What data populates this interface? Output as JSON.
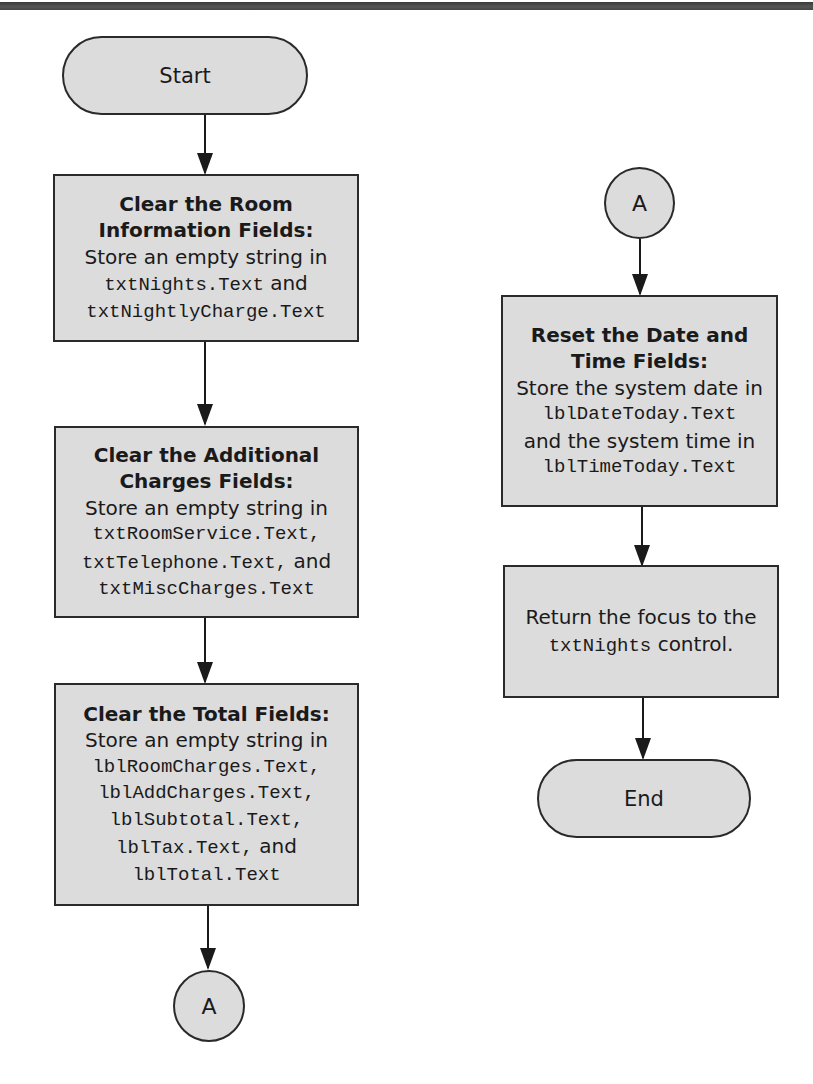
{
  "diagram": {
    "type": "flowchart",
    "colors": {
      "node_fill": "#dcdcdc",
      "stroke": "#2a2a2a",
      "background": "#ffffff"
    },
    "left_column": {
      "start": {
        "label": "Start"
      },
      "step1": {
        "title_lines": [
          "Clear the Room",
          "Information Fields:"
        ],
        "body_line1": "Store an empty string in",
        "code1": "txtNights.Text",
        "text1": " and",
        "code2": "txtNightlyCharge.Text"
      },
      "step2": {
        "title_lines": [
          "Clear the Additional",
          "Charges Fields:"
        ],
        "body_line1": "Store an empty string in",
        "code1": "txtRoomService.Text,",
        "code2": "txtTelephone.Text,",
        "text2": " and",
        "code3": "txtMiscCharges.Text"
      },
      "step3": {
        "title": "Clear the Total Fields:",
        "body_line1": "Store an empty string in",
        "code1": "lblRoomCharges.Text,",
        "code2": "lblAddCharges.Text,",
        "code3": "lblSubtotal.Text,",
        "code4": "lblTax.Text,",
        "text4": " and",
        "code5": "lblTotal.Text"
      },
      "connector": {
        "label": "A"
      }
    },
    "right_column": {
      "connector": {
        "label": "A"
      },
      "step4": {
        "title_lines": [
          "Reset the Date and",
          "Time Fields:"
        ],
        "body_line1": "Store the system date in",
        "code1": "lblDateToday.Text",
        "body_line2": "and the system time in",
        "code2": "lblTimeToday.Text"
      },
      "step5": {
        "body_line1": "Return the focus to the",
        "code1": "txtNights",
        "text1": " control."
      },
      "end": {
        "label": "End"
      }
    }
  }
}
